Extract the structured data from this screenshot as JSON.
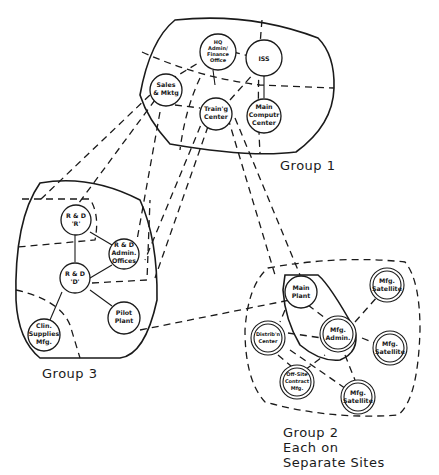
{
  "diagram": {
    "groups": [
      {
        "id": "group1",
        "label": "Group 1"
      },
      {
        "id": "group2",
        "label_lines": [
          "Group 2",
          "Each on",
          "Separate Sites"
        ]
      },
      {
        "id": "group3",
        "label": "Group 3"
      }
    ],
    "nodes": {
      "hq": {
        "lines": [
          "HQ",
          "Admin/",
          "Finance",
          "Office"
        ],
        "group": "group1"
      },
      "iss": {
        "lines": [
          "ISS"
        ],
        "group": "group1"
      },
      "sales": {
        "lines": [
          "Sales",
          "& Mktg"
        ],
        "group": "group1"
      },
      "training": {
        "lines": [
          "Train'g",
          "Center"
        ],
        "group": "group1"
      },
      "computer": {
        "lines": [
          "Main",
          "Computr",
          "Center"
        ],
        "group": "group1"
      },
      "rd_r": {
        "lines": [
          "R & D",
          "'R'"
        ],
        "group": "group3"
      },
      "rd_admin": {
        "lines": [
          "R & D",
          "Admin.",
          "Offices"
        ],
        "group": "group3"
      },
      "rd_d": {
        "lines": [
          "R & D",
          "'D'"
        ],
        "group": "group3"
      },
      "clin": {
        "lines": [
          "Clin.",
          "Supplies",
          "Mfg."
        ],
        "group": "group3"
      },
      "pilot": {
        "lines": [
          "Pilot",
          "Plant"
        ],
        "group": "group3"
      },
      "main_plant": {
        "lines": [
          "Main",
          "Plant"
        ],
        "group": "group2"
      },
      "mfg_admin": {
        "lines": [
          "Mfg.",
          "Admin."
        ],
        "group": "group2"
      },
      "distrib": {
        "lines": [
          "Distrib'n",
          "Center"
        ],
        "group": "group2"
      },
      "offsite": {
        "lines": [
          "Off-Site",
          "Contract",
          "Mfg."
        ],
        "group": "group2"
      },
      "sat1": {
        "lines": [
          "Mfg.",
          "Satellite"
        ],
        "group": "group2"
      },
      "sat2": {
        "lines": [
          "Mfg.",
          "Satellite"
        ],
        "group": "group2"
      },
      "sat3": {
        "lines": [
          "Mfg.",
          "Satellite"
        ],
        "group": "group2"
      }
    }
  }
}
